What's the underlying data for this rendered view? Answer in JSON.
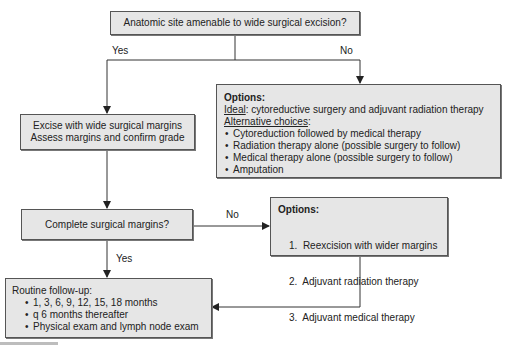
{
  "nodes": {
    "q1": {
      "text": "Anatomic site amenable to wide surgical excision?"
    },
    "excise": {
      "line1": "Excise with wide surgical margins",
      "line2": "Assess margins and confirm grade"
    },
    "options1": {
      "heading": "Options:",
      "ideal_label": "Ideal",
      "ideal_text": ": cytoreductive surgery and adjuvant radiation therapy",
      "alt_label": "Alternative choices",
      "alt_suffix": ":",
      "items": [
        "Cytoreduction followed by medical therapy",
        "Radiation therapy alone (possible surgery to follow)",
        "Medical therapy alone (possible surgery to follow)",
        "Amputation"
      ]
    },
    "q2": {
      "text": "Complete surgical margins?"
    },
    "options2": {
      "heading": "Options:",
      "items": [
        "1.  Reexcision with wider margins",
        "2.  Adjuvant radiation therapy",
        "3.  Adjuvant medical therapy"
      ]
    },
    "followup": {
      "heading": "Routine follow-up:",
      "items": [
        "1, 3, 6, 9, 12, 15, 18 months",
        "q 6 months thereafter",
        "Physical exam and lymph node exam"
      ]
    }
  },
  "edges": {
    "q1_yes": "Yes",
    "q1_no": "No",
    "q2_no": "No",
    "q2_yes": "Yes"
  },
  "colors": {
    "box_fill": "#e6e6e6",
    "line": "#333333",
    "border": "#555555"
  }
}
